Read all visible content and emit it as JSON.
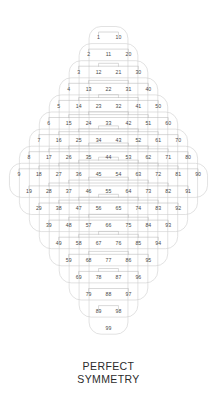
{
  "figure": {
    "caption_line1": "PERFECT",
    "caption_line2": "SYMMETRY",
    "colors": {
      "background": "#ffffff",
      "number_text": "#4a4a4a",
      "bracket_line": "#b9b9b9",
      "outline": "#cfcfcf",
      "caption_text": "#2b2b2b"
    }
  },
  "chart_data": {
    "type": "diagram",
    "row_count": 19,
    "min_value": 1,
    "max_value": 99,
    "widest_row_index": 8,
    "rows": [
      {
        "index": 0,
        "digit_sum": 1,
        "count": 2,
        "values": [
          1,
          10
        ]
      },
      {
        "index": 1,
        "digit_sum": 2,
        "count": 3,
        "values": [
          2,
          11,
          20
        ]
      },
      {
        "index": 2,
        "digit_sum": 3,
        "count": 4,
        "values": [
          3,
          12,
          21,
          30
        ]
      },
      {
        "index": 3,
        "digit_sum": 4,
        "count": 5,
        "values": [
          4,
          13,
          22,
          31,
          40
        ]
      },
      {
        "index": 4,
        "digit_sum": 5,
        "count": 6,
        "values": [
          5,
          14,
          23,
          32,
          41,
          50
        ]
      },
      {
        "index": 5,
        "digit_sum": 6,
        "count": 7,
        "values": [
          6,
          15,
          24,
          33,
          42,
          51,
          60
        ]
      },
      {
        "index": 6,
        "digit_sum": 7,
        "count": 8,
        "values": [
          7,
          16,
          25,
          34,
          43,
          52,
          61,
          70
        ]
      },
      {
        "index": 7,
        "digit_sum": 8,
        "count": 9,
        "values": [
          8,
          17,
          26,
          35,
          44,
          53,
          62,
          71,
          80
        ]
      },
      {
        "index": 8,
        "digit_sum": 9,
        "count": 10,
        "values": [
          9,
          18,
          27,
          36,
          45,
          54,
          63,
          72,
          81,
          90
        ]
      },
      {
        "index": 9,
        "digit_sum": 10,
        "count": 9,
        "values": [
          19,
          28,
          37,
          46,
          55,
          64,
          73,
          82,
          91
        ]
      },
      {
        "index": 10,
        "digit_sum": 11,
        "count": 8,
        "values": [
          29,
          38,
          47,
          56,
          65,
          74,
          83,
          92
        ]
      },
      {
        "index": 11,
        "digit_sum": 12,
        "count": 7,
        "values": [
          39,
          48,
          57,
          66,
          75,
          84,
          93
        ]
      },
      {
        "index": 12,
        "digit_sum": 13,
        "count": 6,
        "values": [
          49,
          58,
          67,
          76,
          85,
          94
        ]
      },
      {
        "index": 13,
        "digit_sum": 14,
        "count": 5,
        "values": [
          59,
          68,
          77,
          86,
          95
        ]
      },
      {
        "index": 14,
        "digit_sum": 15,
        "count": 4,
        "values": [
          69,
          78,
          87,
          96
        ]
      },
      {
        "index": 15,
        "digit_sum": 16,
        "count": 3,
        "values": [
          79,
          88,
          97
        ]
      },
      {
        "index": 16,
        "digit_sum": 17,
        "count": 2,
        "values": [
          89,
          98
        ]
      },
      {
        "index": 17,
        "digit_sum": 18,
        "count": 1,
        "values": [
          99
        ]
      }
    ]
  }
}
